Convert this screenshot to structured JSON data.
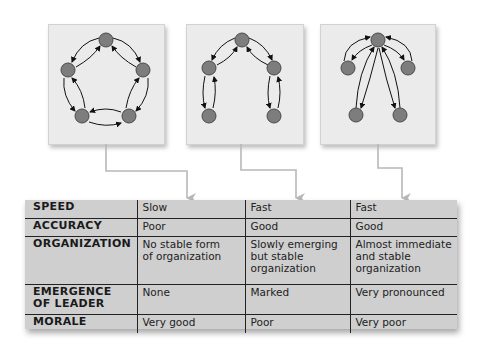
{
  "colors": {
    "node_fill": "#7d7d7d",
    "node_stroke": "#4a4a4a",
    "box_fill": "#ebebeb",
    "connector": "#b8b8b8",
    "table_fill": "#cfcfcf",
    "rule": "#222222"
  },
  "networks": [
    {
      "name": "circle-network",
      "description": "five members, each communicates with two neighbors in a ring"
    },
    {
      "name": "chain-network",
      "description": "five members in a chain, central member links two branches"
    },
    {
      "name": "wheel-network",
      "description": "central member communicates with all four others"
    }
  ],
  "table": {
    "rows": [
      {
        "label": "SPEED",
        "values": [
          "Slow",
          "Fast",
          "Fast"
        ]
      },
      {
        "label": "ACCURACY",
        "values": [
          "Poor",
          "Good",
          "Good"
        ]
      },
      {
        "label": "ORGANIZATION",
        "values": [
          "No stable form\nof organization",
          "Slowly emerging\nbut stable\norganization",
          "Almost immediate\nand stable\norganization"
        ]
      },
      {
        "label": "EMERGENCE\nOF LEADER",
        "values": [
          "None",
          "Marked",
          "Very pronounced"
        ]
      },
      {
        "label": "MORALE",
        "values": [
          "Very good",
          "Poor",
          "Very poor"
        ]
      }
    ]
  }
}
